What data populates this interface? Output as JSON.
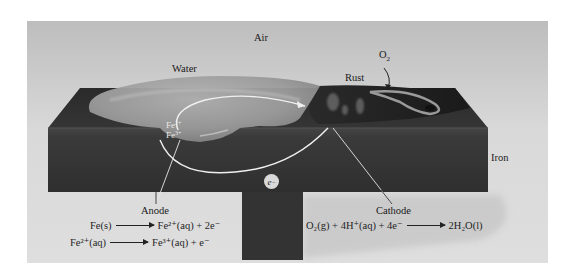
{
  "figure": {
    "labels": {
      "air": "Air",
      "water": "Water",
      "rust": "Rust",
      "oxygen": "O",
      "oxygen_sub": "2",
      "iron": "Iron",
      "anode": "Anode",
      "cathode": "Cathode",
      "fe2_ion": "Fe",
      "fe2_charge": "2+",
      "fe3_ion": "Fe",
      "fe3_charge": "3+",
      "electron": "e",
      "electron_charge": "−"
    },
    "anode_reactions": [
      {
        "reactant": "Fe(s)",
        "product": "Fe²⁺(aq) + 2e⁻"
      },
      {
        "reactant": "Fe²⁺(aq)",
        "product": "Fe³⁺(aq) + e⁻"
      }
    ],
    "cathode_reaction": {
      "reactant": "O₂(g) + 4H⁺(aq) + 4e⁻",
      "product": "2H₂O(l)"
    },
    "colors": {
      "background_panel": "#d6d6d6",
      "iron_top": "#2e2e2e",
      "iron_front": "#3a3a3a",
      "water": "#9a9a9a",
      "rust": "#1f1f1f",
      "circuit_line": "#f2f2f2"
    }
  }
}
